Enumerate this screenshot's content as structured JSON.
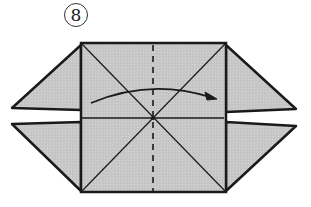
{
  "diagram": {
    "type": "origami-instruction",
    "step": {
      "number": "8",
      "label_style": "circled-number"
    },
    "colors": {
      "paper_fill": "#c8c8c8",
      "line": "#1a1a1a",
      "background": "#ffffff"
    },
    "elements": {
      "square": "central square with both diagonals and a horizontal center crease",
      "valley_fold_line": "vertical dashed line through center",
      "fold_arrow": "curved arrow from left to right indicating folding left half over to right",
      "flaps": [
        "upper-left triangle flap",
        "lower-left triangle flap",
        "upper-right triangle flap",
        "lower-right triangle flap"
      ]
    }
  }
}
